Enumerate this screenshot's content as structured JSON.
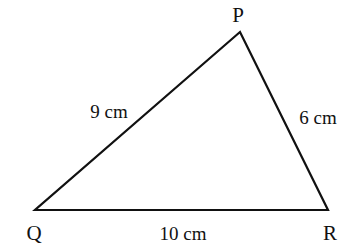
{
  "diagram": {
    "type": "triangle",
    "vertices": [
      {
        "name": "P",
        "x": 240,
        "y": 32
      },
      {
        "name": "Q",
        "x": 35,
        "y": 210
      },
      {
        "name": "R",
        "x": 328,
        "y": 210
      }
    ],
    "sides": [
      {
        "from": "Q",
        "to": "P",
        "label": "9 cm"
      },
      {
        "from": "P",
        "to": "R",
        "label": "6 cm"
      },
      {
        "from": "Q",
        "to": "R",
        "label": "10 cm"
      }
    ],
    "labels": {
      "P": "P",
      "Q": "Q",
      "R": "R",
      "qp": "9 cm",
      "pr": "6 cm",
      "qr": "10 cm"
    },
    "stroke_color": "#111111"
  }
}
